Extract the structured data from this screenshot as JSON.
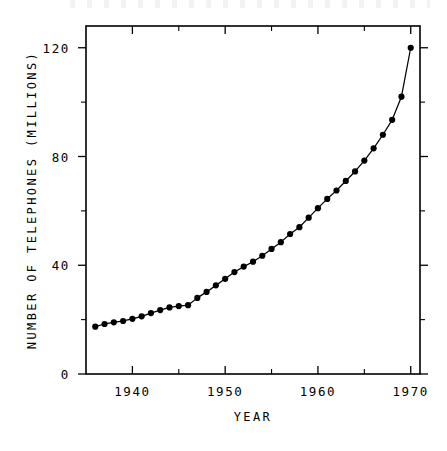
{
  "chart_data": {
    "type": "line",
    "title": "",
    "xlabel": "YEAR",
    "ylabel": "NUMBER OF TELEPHONES (MILLIONS)",
    "xlim": [
      1935,
      1971
    ],
    "ylim": [
      0,
      128
    ],
    "grid": false,
    "legend": "none",
    "marker": "filled-circle",
    "line_color": "#000000",
    "marker_color": "#000000",
    "x_ticks_major": [
      1940,
      1950,
      1960,
      1970
    ],
    "x_tick_labels": [
      "1940",
      "1950",
      "1960",
      "1970"
    ],
    "x_ticks_minor": [
      1935,
      1945,
      1955,
      1965
    ],
    "y_ticks_major": [
      0,
      40,
      80,
      120
    ],
    "y_tick_labels": [
      "0",
      "40",
      "80",
      "120"
    ],
    "y_ticks_minor": [
      20,
      60,
      100
    ],
    "series": [
      {
        "name": "Number of telephones",
        "x": [
          1936,
          1937,
          1938,
          1939,
          1940,
          1941,
          1942,
          1943,
          1944,
          1945,
          1946,
          1947,
          1948,
          1949,
          1950,
          1951,
          1952,
          1953,
          1954,
          1955,
          1956,
          1957,
          1958,
          1959,
          1960,
          1961,
          1962,
          1963,
          1964,
          1965,
          1966,
          1967,
          1968,
          1969,
          1970
        ],
        "y": [
          17.4,
          18.4,
          19.0,
          19.5,
          20.3,
          21.2,
          22.4,
          23.5,
          24.5,
          25.0,
          25.3,
          28.0,
          30.2,
          32.6,
          35.0,
          37.5,
          39.5,
          41.3,
          43.5,
          46.0,
          48.5,
          51.5,
          54.0,
          57.5,
          61.0,
          64.4,
          67.5,
          71.0,
          74.5,
          78.5,
          83.0,
          88.0,
          93.5,
          102.0,
          120.0
        ]
      }
    ]
  },
  "axis_titles": {
    "x": "YEAR",
    "y": "NUMBER OF TELEPHONES (MILLIONS)"
  }
}
